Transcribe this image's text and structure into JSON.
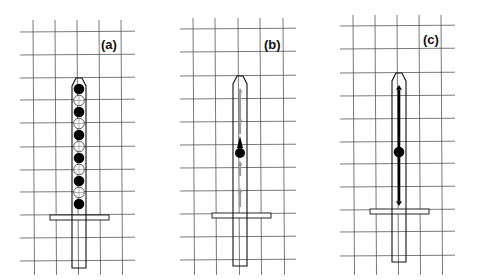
{
  "figure": {
    "width": 477,
    "height": 280,
    "colors": {
      "grid": "#555555",
      "rod": "#111111",
      "filled_circle": "#000000",
      "open_circle": "#ffffff",
      "gray_arrow": "#9a9a9a",
      "black_arrow": "#000000"
    }
  },
  "panels": [
    {
      "label": "(a)",
      "label_pos": [
        101,
        38
      ],
      "grid": {
        "x_lines": [
          33,
          55,
          77,
          99,
          121
        ],
        "y_lines": [
          32,
          55,
          78,
          100,
          123,
          147,
          170,
          192,
          215,
          238,
          261
        ],
        "x_extent": [
          20,
          135
        ],
        "y_extent": [
          20,
          275
        ]
      },
      "rod": {
        "cx": 79,
        "top": 78,
        "shoulder": 86,
        "bottom": 268,
        "half_width": 7
      },
      "guard": {
        "x1": 50,
        "x2": 109,
        "y": 215,
        "height": 5
      },
      "beads": {
        "start_y": 89,
        "step": 11.5,
        "r": 5.3,
        "pattern": [
          "filled",
          "open",
          "filled",
          "open",
          "filled",
          "open",
          "filled",
          "open",
          "filled",
          "open",
          "filled"
        ]
      }
    },
    {
      "label": "(b)",
      "label_pos": [
        264,
        38
      ],
      "grid": {
        "x_lines": [
          193,
          215,
          238,
          260,
          283
        ],
        "y_lines": [
          29,
          52,
          76,
          99,
          122,
          145,
          168,
          191,
          214,
          237,
          260
        ],
        "x_extent": [
          180,
          296
        ],
        "y_extent": [
          18,
          275
        ]
      },
      "rod": {
        "cx": 240,
        "top": 76,
        "shoulder": 84,
        "bottom": 266,
        "half_width": 7
      },
      "guard": {
        "x1": 212,
        "x2": 271,
        "y": 213,
        "height": 5
      },
      "dot": {
        "cx": 240,
        "cy": 153,
        "r": 5
      },
      "black_arrowhead": {
        "x": 240,
        "tip_y": 136,
        "base_y": 148
      },
      "gray_arrows": [
        {
          "x": 240,
          "y_from": 120,
          "y_to": 88
        },
        {
          "x": 240,
          "y_from": 134,
          "y_to": 117
        },
        {
          "x": 240,
          "y_from": 176,
          "y_to": 161
        },
        {
          "x": 240,
          "y_from": 207,
          "y_to": 188
        }
      ]
    },
    {
      "label": "(c)",
      "label_pos": [
        423,
        33
      ],
      "grid": {
        "x_lines": [
          353,
          375,
          397,
          419,
          441
        ],
        "y_lines": [
          26,
          49,
          73,
          96,
          119,
          142,
          164,
          187,
          210,
          232,
          256
        ],
        "x_extent": [
          340,
          455
        ],
        "y_extent": [
          15,
          275
        ]
      },
      "rod": {
        "cx": 399,
        "top": 73,
        "shoulder": 81,
        "bottom": 262,
        "half_width": 7
      },
      "guard": {
        "x1": 370,
        "x2": 429,
        "y": 209,
        "height": 5
      },
      "dot": {
        "cx": 399,
        "cy": 152,
        "r": 5.3
      },
      "double_arrow": {
        "x": 399,
        "top_y": 85,
        "bottom_y": 206,
        "stroke": 2.6
      }
    }
  ]
}
